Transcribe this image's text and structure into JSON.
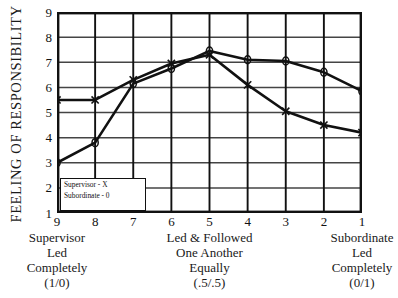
{
  "chart_data": {
    "type": "line",
    "title": "",
    "xlabel": "",
    "ylabel": "FEELING OF RESPONSIBILITY",
    "x": [
      9,
      8,
      7,
      6,
      5,
      4,
      3,
      2,
      1
    ],
    "xticklabels": [
      "9",
      "8",
      "7",
      "6",
      "5",
      "4",
      "3",
      "2",
      "1"
    ],
    "yticklabels": [
      "9",
      "8",
      "7",
      "6",
      "5",
      "4",
      "3",
      "2",
      "1"
    ],
    "ylim": [
      1,
      9
    ],
    "xlim": [
      9,
      1
    ],
    "grid": true,
    "legend_position": "inside-lower-left",
    "series": [
      {
        "name": "Supervisor - X",
        "marker": "x",
        "values": [
          5.5,
          5.5,
          6.3,
          6.95,
          7.3,
          6.1,
          5.05,
          4.5,
          4.2
        ]
      },
      {
        "name": "Subordinate - 0",
        "marker": "o",
        "values": [
          3.0,
          3.8,
          6.15,
          6.75,
          7.45,
          7.1,
          7.05,
          6.6,
          5.85
        ]
      }
    ],
    "legend": [
      "Supervisor - X",
      "Subordinate - 0"
    ],
    "axis_captions": [
      {
        "lines": [
          "Supervisor",
          "Led",
          "Completely",
          "(1/0)"
        ],
        "at_x": "9"
      },
      {
        "lines": [
          "Led & Followed",
          "One Another",
          "Equally",
          "(.5/.5)"
        ],
        "at_x": "5"
      },
      {
        "lines": [
          "Subordinate",
          "Led",
          "Completely",
          "(0/1)"
        ],
        "at_x": "1"
      }
    ],
    "colors": {
      "line": "#111111",
      "grid": "#444444",
      "frame": "#111111",
      "background": "#ffffff"
    }
  }
}
